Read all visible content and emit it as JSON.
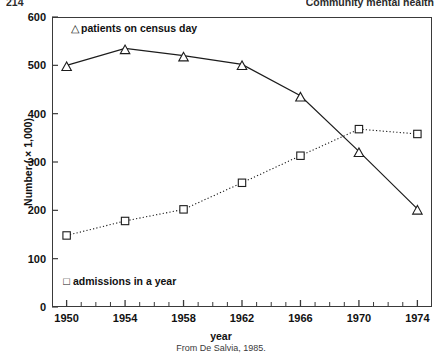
{
  "running_head": {
    "page_number": "214",
    "title": "Community mental health"
  },
  "source_caption": "From De Salvia, 1985.",
  "legend": {
    "census": {
      "marker": "triangle-outline",
      "glyph": "△",
      "label": "patients on census day"
    },
    "admissions": {
      "marker": "square-outline",
      "glyph": "□",
      "label": "admissions in a year"
    }
  },
  "chart_data": {
    "type": "line",
    "title": "",
    "subtitle": "",
    "xlabel": "year",
    "ylabel": "Number ( × 1,000)",
    "x": [
      1950,
      1954,
      1958,
      1962,
      1966,
      1970,
      1974
    ],
    "xlim": [
      1949,
      1975
    ],
    "ylim": [
      0,
      600
    ],
    "x_tick_labels": [
      "1950",
      "1954",
      "1958",
      "1962",
      "1966",
      "1970",
      "1974"
    ],
    "y_tick_labels": [
      "0",
      "100",
      "200",
      "300",
      "400",
      "500",
      "600"
    ],
    "y_ticks": [
      0,
      100,
      200,
      300,
      400,
      500,
      600
    ],
    "x_minor_tick_interval": 1,
    "grid": false,
    "legend_position": "inside",
    "series": [
      {
        "name": "patients on census day",
        "marker": "triangle-outline",
        "line_style": "solid",
        "values": [
          500,
          535,
          520,
          502,
          437,
          322,
          203
        ]
      },
      {
        "name": "admissions in a year",
        "marker": "square-outline",
        "line_style": "dotted",
        "values": [
          148,
          178,
          202,
          257,
          313,
          368,
          358
        ]
      }
    ]
  }
}
